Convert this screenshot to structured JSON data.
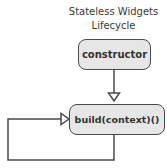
{
  "diagram": {
    "title_line1": "Stateless Widgets",
    "title_line2": "Lifecycle",
    "nodes": [
      {
        "id": "constructor",
        "label": "constructor"
      },
      {
        "id": "build",
        "label": "build(context)()"
      }
    ],
    "edges": [
      {
        "from": "constructor",
        "to": "build",
        "type": "arrow"
      },
      {
        "from": "build",
        "to": "build",
        "type": "loop-arrow"
      }
    ],
    "colors": {
      "box_fill": "#e6e6e6",
      "box_border": "#4a4a4a",
      "line": "#4a4a4a",
      "text": "#333333"
    }
  }
}
